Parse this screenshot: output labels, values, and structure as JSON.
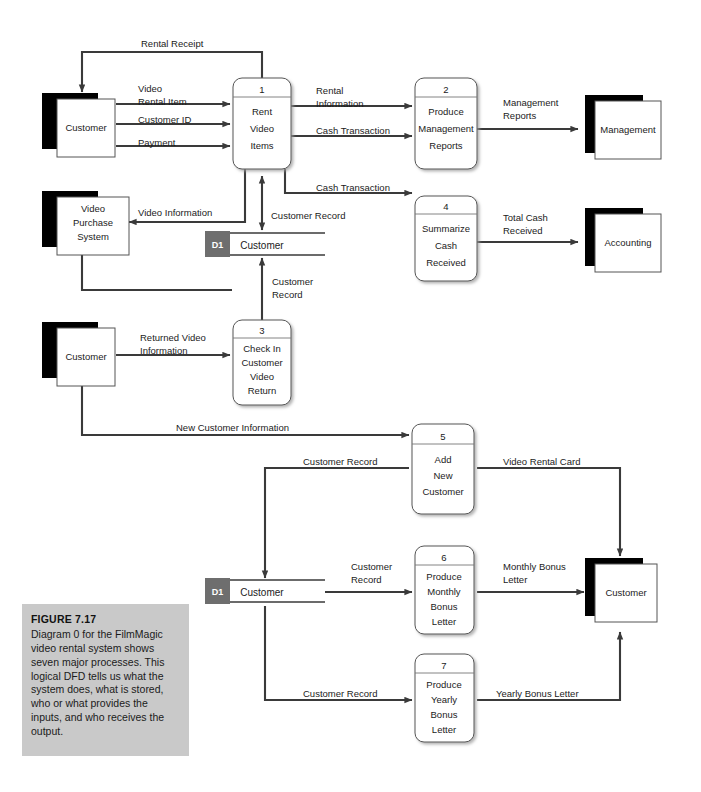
{
  "figure": {
    "title": "FIGURE 7.17",
    "caption": "Diagram 0 for the FilmMagic video rental system shows seven major processes. This logical DFD tells us what the system does, what is stored, who or what provides the inputs, and who receives the output."
  },
  "entities": {
    "customer_top": "Customer",
    "video_purchase_system": "Video\nPurchase\nSystem",
    "vps_l1": "Video",
    "vps_l2": "Purchase",
    "vps_l3": "System",
    "management": "Management",
    "accounting": "Accounting",
    "customer_mid": "Customer",
    "customer_right": "Customer"
  },
  "processes": [
    {
      "num": "1",
      "lines": [
        "Rent",
        "Video",
        "Items"
      ]
    },
    {
      "num": "2",
      "lines": [
        "Produce",
        "Management",
        "Reports"
      ]
    },
    {
      "num": "3",
      "lines": [
        "Check In",
        "Customer",
        "Video",
        "Return"
      ]
    },
    {
      "num": "4",
      "lines": [
        "Summarize",
        "Cash",
        "Received"
      ]
    },
    {
      "num": "5",
      "lines": [
        "Add",
        "New",
        "Customer"
      ]
    },
    {
      "num": "6",
      "lines": [
        "Produce",
        "Monthly",
        "Bonus",
        "Letter"
      ]
    },
    {
      "num": "7",
      "lines": [
        "Produce",
        "Yearly",
        "Bonus",
        "Letter"
      ]
    }
  ],
  "datastores": [
    {
      "id": "D1",
      "label": "Customer"
    },
    {
      "id": "D1",
      "label": "Customer"
    }
  ],
  "flows": {
    "rental_receipt": "Rental Receipt",
    "video_rental_item_1": "Video",
    "video_rental_item_2": "Rental Item",
    "customer_id": "Customer ID",
    "payment": "Payment",
    "rental_information_1": "Rental",
    "rental_information_2": "Information",
    "cash_transaction_top": "Cash Transaction",
    "management_reports_1": "Management",
    "management_reports_2": "Reports",
    "cash_transaction_mid": "Cash Transaction",
    "video_information": "Video Information",
    "customer_record_top": "Customer Record",
    "total_cash_received_1": "Total Cash",
    "total_cash_received_2": "Received",
    "customer_record_p3_1": "Customer",
    "customer_record_p3_2": "Record",
    "returned_video_information_1": "Returned Video",
    "returned_video_information_2": "Information",
    "new_customer_information": "New Customer Information",
    "customer_record_p5": "Customer Record",
    "video_rental_card": "Video Rental Card",
    "customer_record_p6_1": "Customer",
    "customer_record_p6_2": "Record",
    "monthly_bonus_letter_1": "Monthly Bonus",
    "monthly_bonus_letter_2": "Letter",
    "customer_record_p7": "Customer Record",
    "yearly_bonus_letter": "Yearly Bonus Letter"
  },
  "colors": {
    "line": "#3a3a3a",
    "shadow": "#000000",
    "store_id_bg": "#6e6e6e",
    "caption_bg": "#c9c9c9",
    "box_stroke": "#555555"
  }
}
